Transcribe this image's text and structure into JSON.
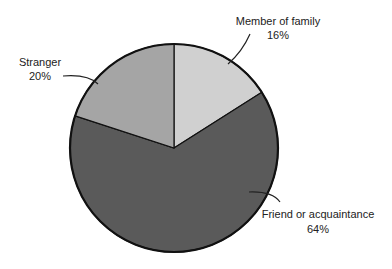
{
  "chart_data": {
    "type": "pie",
    "title": "",
    "start_angle_deg": 0,
    "direction": "clockwise",
    "slices": [
      {
        "label": "Member of family",
        "value": 16,
        "value_label": "16%",
        "color": "#d0d0d0"
      },
      {
        "label": "Friend or acquaintance",
        "value": 64,
        "value_label": "64%",
        "color": "#5a5a5a"
      },
      {
        "label": "Stranger",
        "value": 20,
        "value_label": "20%",
        "color": "#a5a5a5"
      }
    ],
    "legend": "none",
    "labels_position": "outside with leader lines"
  },
  "labels": {
    "family": {
      "name": "Member of family",
      "pct": "16%"
    },
    "friend": {
      "name": "Friend or acquaintance",
      "pct": "64%"
    },
    "stranger": {
      "name": "Stranger",
      "pct": "20%"
    }
  }
}
